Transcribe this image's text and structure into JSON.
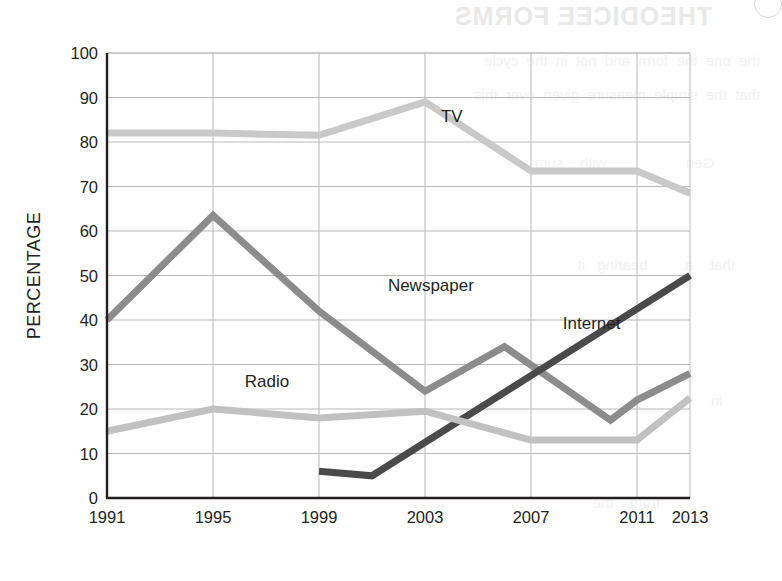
{
  "bleed": {
    "title": "THEODICEE FORMS",
    "body": "the  one  the  form  and  not  in  the  cycle\nthat  the  simple  measure  given  over  this\n\n           Gen                   with    sum\n\n\n      that    a         bearing   it\n\n\n\n         in\n\n\n                        from    the\n"
  },
  "chart_data": {
    "type": "line",
    "title": "",
    "xlabel": "",
    "ylabel": "PERCENTAGE",
    "xlim": [
      1991,
      2013
    ],
    "ylim": [
      0,
      100
    ],
    "grid": true,
    "legend_position": "inline-labels",
    "x_ticks": [
      1991,
      1995,
      1999,
      2003,
      2007,
      2011,
      2013
    ],
    "x_tick_labels": [
      "1991",
      "1995",
      "1999",
      "2003",
      "2007",
      "2011",
      "2013"
    ],
    "x_gridlines": [
      1991,
      1995,
      1999,
      2003,
      2007,
      2011
    ],
    "y_ticks": [
      0,
      10,
      20,
      30,
      40,
      50,
      60,
      70,
      80,
      90,
      100
    ],
    "y_tick_labels": [
      "0",
      "10",
      "20",
      "30",
      "40",
      "50",
      "60",
      "70",
      "80",
      "90",
      "100"
    ],
    "series": [
      {
        "name": "TV",
        "color": "#c9c9c9",
        "width": 7,
        "label_x": 2003.6,
        "label_y": 84.5,
        "points": [
          {
            "x": 1991,
            "y": 82
          },
          {
            "x": 1995,
            "y": 82
          },
          {
            "x": 1999,
            "y": 81.5
          },
          {
            "x": 2003,
            "y": 89
          },
          {
            "x": 2007,
            "y": 73.5
          },
          {
            "x": 2011,
            "y": 73.5
          },
          {
            "x": 2013,
            "y": 68.5
          }
        ]
      },
      {
        "name": "Newspaper",
        "color": "#8c8c8c",
        "width": 7,
        "label_x": 2001.6,
        "label_y": 46.5,
        "points": [
          {
            "x": 1991,
            "y": 40
          },
          {
            "x": 1995,
            "y": 63.5
          },
          {
            "x": 1999,
            "y": 42
          },
          {
            "x": 2003,
            "y": 24
          },
          {
            "x": 2006,
            "y": 34
          },
          {
            "x": 2010,
            "y": 17.5
          },
          {
            "x": 2011,
            "y": 22
          },
          {
            "x": 2013,
            "y": 28
          }
        ]
      },
      {
        "name": "Internet",
        "color": "#4a4a4a",
        "width": 7,
        "label_x": 2008.2,
        "label_y": 38,
        "points": [
          {
            "x": 1999,
            "y": 6
          },
          {
            "x": 2001,
            "y": 5
          },
          {
            "x": 2013,
            "y": 50
          }
        ]
      },
      {
        "name": "Radio",
        "color": "#c1c1c1",
        "width": 7,
        "label_x": 1996.2,
        "label_y": 25,
        "points": [
          {
            "x": 1991,
            "y": 15
          },
          {
            "x": 1995,
            "y": 20
          },
          {
            "x": 1999,
            "y": 18
          },
          {
            "x": 2003,
            "y": 19.5
          },
          {
            "x": 2007,
            "y": 13
          },
          {
            "x": 2011,
            "y": 13
          },
          {
            "x": 2013,
            "y": 22.5
          }
        ]
      }
    ]
  }
}
